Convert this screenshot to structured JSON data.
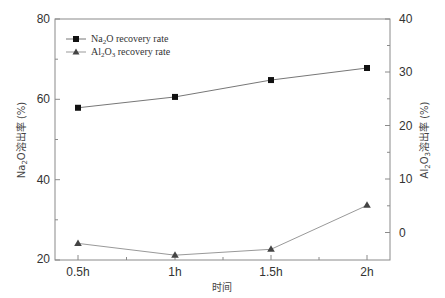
{
  "chart_data": {
    "type": "line",
    "title": "",
    "xlabel": "时间",
    "ylabel": "Na2O溶出率 (%)",
    "ylabel_right": "Al2O3溶出率 (%)",
    "categories": [
      "0.5h",
      "1h",
      "1.5h",
      "2h"
    ],
    "series": [
      {
        "name": "Na2O recovery rate",
        "axis": "left",
        "marker": "square",
        "values": [
          57.9,
          60.6,
          64.8,
          67.8
        ]
      },
      {
        "name": "Al2O3 recovery rate",
        "axis": "right",
        "marker": "triangle",
        "values": [
          -1.9,
          -4.1,
          -3.0,
          5.2
        ]
      }
    ],
    "ylim": [
      20,
      80
    ],
    "ylim_right": [
      -5,
      40
    ],
    "yticks": [
      20,
      40,
      60,
      80
    ],
    "yticks_right": [
      0,
      10,
      20,
      30,
      40
    ],
    "grid": false,
    "legend_position": "upper left"
  },
  "labels": {
    "xlabel": "时间",
    "ylabel_left_main": "Na",
    "ylabel_left_sub": "2",
    "ylabel_left_rest": "O溶出率 (%)",
    "ylabel_right_main": "Al",
    "ylabel_right_sub1": "2",
    "ylabel_right_mid": "O",
    "ylabel_right_sub2": "3",
    "ylabel_right_rest": "溶出率 (%)",
    "legend": [
      {
        "pre": "Na",
        "sub": "2",
        "post": "O recovery rate"
      },
      {
        "pre": "Al",
        "sub": "2",
        "mid": "O",
        "sub2": "3",
        "post": " recovery rate"
      }
    ],
    "yticks_left": [
      "20",
      "40",
      "60",
      "80"
    ],
    "yticks_right": [
      "0",
      "10",
      "20",
      "30",
      "40"
    ],
    "xticks": [
      "0.5h",
      "1h",
      "1.5h",
      "2h"
    ]
  },
  "colors": {
    "axis": "#888888",
    "line": "#888888",
    "marker_na": "#111111",
    "marker_al": "#444444"
  }
}
